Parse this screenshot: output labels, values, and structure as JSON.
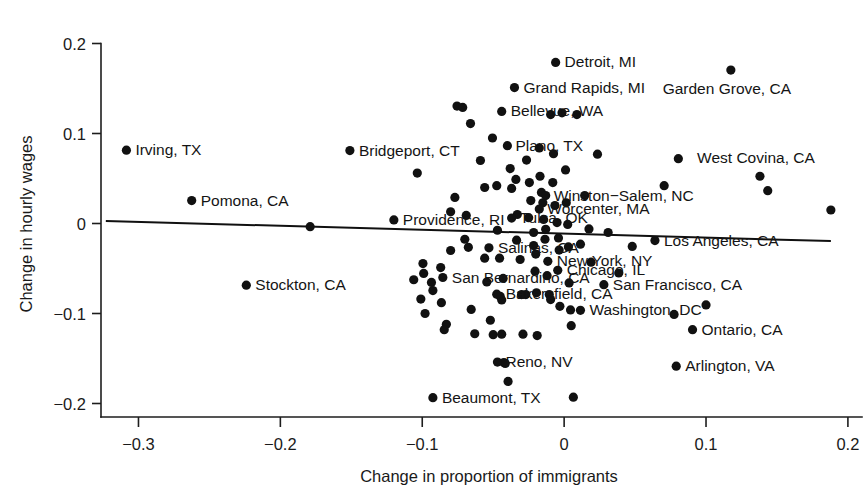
{
  "chart_data": {
    "type": "scatter",
    "title": "",
    "xlabel": "Change in proportion of immigrants",
    "ylabel": "Change in hourly wages",
    "xlim": [
      -0.325,
      0.205
    ],
    "ylim": [
      -0.215,
      0.215
    ],
    "xticks": [
      -0.3,
      -0.2,
      -0.1,
      0,
      0.1,
      0.2
    ],
    "xticklabels": [
      "−0.3",
      "−0.2",
      "−0.1",
      "0",
      "0.1",
      "0.2"
    ],
    "yticks": [
      0.2,
      0.1,
      0,
      -0.1,
      -0.2
    ],
    "yticklabels": [
      "0.2",
      "0.1",
      "0",
      "−0.1",
      "−0.2"
    ],
    "grid": false,
    "legend": null,
    "marker_color": "#111111",
    "trendline": {
      "present": true,
      "color": "#101010",
      "x0": -0.323,
      "y0": 0.0028,
      "x1": 0.188,
      "y1": -0.0195,
      "slope": -0.0436,
      "intercept": -0.0113
    },
    "labeled_points": [
      {
        "city": "Irving, TX",
        "x": -0.3085,
        "y": 0.0815,
        "label_dx": 9,
        "label_dy": 5
      },
      {
        "city": "Pomona, CA",
        "x": -0.2625,
        "y": 0.0255,
        "label_dx": 9,
        "label_dy": 5
      },
      {
        "city": "Stockton, CA",
        "x": -0.224,
        "y": -0.0685,
        "label_dx": 9,
        "label_dy": 5
      },
      {
        "city": "Bridgeport, CT",
        "x": -0.151,
        "y": 0.081,
        "label_dx": 9,
        "label_dy": 5
      },
      {
        "city": "Providence, RI",
        "x": -0.12,
        "y": 0.004,
        "label_dx": 9,
        "label_dy": 5
      },
      {
        "city": "Beaumont, TX",
        "x": -0.0925,
        "y": -0.1935,
        "label_dx": 9,
        "label_dy": 5
      },
      {
        "city": "San Bernardino, CA",
        "x": -0.0855,
        "y": -0.06,
        "label_dx": 9,
        "label_dy": 5
      },
      {
        "city": "Salinas, CA",
        "x": -0.053,
        "y": -0.027,
        "label_dx": 9,
        "label_dy": 5
      },
      {
        "city": "Bakersfield, CA",
        "x": -0.0475,
        "y": -0.0785,
        "label_dx": 9,
        "label_dy": 5
      },
      {
        "city": "Reno, NV",
        "x": -0.047,
        "y": -0.154,
        "label_dx": 8,
        "label_dy": 5
      },
      {
        "city": "Tulsa, OK",
        "x": -0.037,
        "y": 0.006,
        "label_dx": 8,
        "label_dy": 5
      },
      {
        "city": "Grand Rapids, MI",
        "x": -0.035,
        "y": 0.151,
        "label_dx": 9,
        "label_dy": 5
      },
      {
        "city": "Bellevue, WA",
        "x": -0.044,
        "y": 0.1245,
        "label_dx": 9,
        "label_dy": 5
      },
      {
        "city": "Plano, TX",
        "x": -0.04,
        "y": 0.0865,
        "label_dx": 8,
        "label_dy": 5
      },
      {
        "city": "Worcenter, MA",
        "x": -0.0175,
        "y": 0.016,
        "label_dx": 8,
        "label_dy": 5
      },
      {
        "city": "Winston−Salem, NC",
        "x": -0.013,
        "y": 0.031,
        "label_dx": 8,
        "label_dy": 5
      },
      {
        "city": "New York, NY",
        "x": -0.0115,
        "y": -0.042,
        "label_dx": 9,
        "label_dy": 5
      },
      {
        "city": "Chicago, IL",
        "x": -0.0045,
        "y": -0.052,
        "label_dx": 9,
        "label_dy": 5
      },
      {
        "city": "Detroit, MI",
        "x": -0.006,
        "y": 0.179,
        "label_dx": 9,
        "label_dy": 5
      },
      {
        "city": "Washington, DC",
        "x": 0.0115,
        "y": -0.0965,
        "label_dx": 9,
        "label_dy": 5
      },
      {
        "city": "San Francisco, CA",
        "x": 0.028,
        "y": -0.068,
        "label_dx": 9,
        "label_dy": 5
      },
      {
        "city": "Los Angeles, CA",
        "x": 0.064,
        "y": -0.019,
        "label_dx": 9,
        "label_dy": 5
      },
      {
        "city": "Arlington, VA",
        "x": 0.079,
        "y": -0.1585,
        "label_dx": 9,
        "label_dy": 5
      },
      {
        "city": "Ontario, CA",
        "x": 0.0905,
        "y": -0.118,
        "label_dx": 9,
        "label_dy": 5
      },
      {
        "city": "Garden Grove, CA",
        "x": 0.1175,
        "y": 0.1705,
        "label_dx": -4,
        "label_dy": 24
      },
      {
        "city": "West Covina, CA",
        "x": 0.138,
        "y": 0.0525,
        "label_dx": -4,
        "label_dy": -13
      }
    ],
    "unlabeled_points": [
      {
        "x": -0.179,
        "y": -0.0035
      },
      {
        "x": -0.1035,
        "y": 0.056
      },
      {
        "x": -0.106,
        "y": -0.0625
      },
      {
        "x": -0.0995,
        "y": -0.0445
      },
      {
        "x": -0.099,
        "y": -0.0555
      },
      {
        "x": -0.101,
        "y": -0.084
      },
      {
        "x": -0.098,
        "y": -0.1
      },
      {
        "x": -0.0925,
        "y": -0.0745
      },
      {
        "x": -0.0935,
        "y": -0.0655
      },
      {
        "x": -0.087,
        "y": -0.049
      },
      {
        "x": -0.0865,
        "y": -0.088
      },
      {
        "x": -0.083,
        "y": -0.112
      },
      {
        "x": -0.0845,
        "y": -0.118
      },
      {
        "x": -0.08,
        "y": -0.03
      },
      {
        "x": -0.077,
        "y": 0.029
      },
      {
        "x": -0.08,
        "y": 0.013
      },
      {
        "x": -0.0755,
        "y": 0.1305
      },
      {
        "x": -0.0715,
        "y": 0.129
      },
      {
        "x": -0.069,
        "y": 0.009
      },
      {
        "x": -0.07,
        "y": -0.0175
      },
      {
        "x": -0.0675,
        "y": -0.0265
      },
      {
        "x": -0.066,
        "y": 0.111
      },
      {
        "x": -0.0655,
        "y": -0.0955
      },
      {
        "x": -0.063,
        "y": -0.1225
      },
      {
        "x": -0.059,
        "y": 0.07
      },
      {
        "x": -0.056,
        "y": 0.04
      },
      {
        "x": -0.056,
        "y": -0.0385
      },
      {
        "x": -0.0545,
        "y": -0.065
      },
      {
        "x": -0.052,
        "y": -0.1075
      },
      {
        "x": -0.05,
        "y": -0.1235
      },
      {
        "x": -0.0505,
        "y": 0.095
      },
      {
        "x": -0.0475,
        "y": 0.042
      },
      {
        "x": -0.047,
        "y": -0.0075
      },
      {
        "x": -0.0455,
        "y": -0.0385
      },
      {
        "x": -0.043,
        "y": -0.061
      },
      {
        "x": -0.045,
        "y": -0.081
      },
      {
        "x": -0.044,
        "y": -0.085
      },
      {
        "x": -0.044,
        "y": -0.123
      },
      {
        "x": -0.0415,
        "y": -0.1555
      },
      {
        "x": -0.0425,
        "y": -0.1545
      },
      {
        "x": -0.0395,
        "y": -0.1755
      },
      {
        "x": -0.038,
        "y": 0.061
      },
      {
        "x": -0.037,
        "y": 0.039
      },
      {
        "x": -0.034,
        "y": 0.049
      },
      {
        "x": -0.033,
        "y": 0.01
      },
      {
        "x": -0.0335,
        "y": -0.0185
      },
      {
        "x": -0.031,
        "y": -0.04
      },
      {
        "x": -0.03,
        "y": -0.079
      },
      {
        "x": -0.029,
        "y": -0.123
      },
      {
        "x": -0.027,
        "y": -0.079
      },
      {
        "x": -0.0265,
        "y": 0.0705
      },
      {
        "x": -0.0245,
        "y": 0.0455
      },
      {
        "x": -0.0235,
        "y": 0.0255
      },
      {
        "x": -0.025,
        "y": 0.0065
      },
      {
        "x": -0.0215,
        "y": -0.01
      },
      {
        "x": -0.0215,
        "y": -0.0245
      },
      {
        "x": -0.02,
        "y": -0.034
      },
      {
        "x": -0.0205,
        "y": -0.053
      },
      {
        "x": -0.0195,
        "y": -0.077
      },
      {
        "x": -0.019,
        "y": -0.1245
      },
      {
        "x": -0.0175,
        "y": 0.084
      },
      {
        "x": -0.017,
        "y": 0.0525
      },
      {
        "x": -0.016,
        "y": 0.0345
      },
      {
        "x": -0.015,
        "y": 0.023
      },
      {
        "x": -0.0145,
        "y": 0.0045
      },
      {
        "x": -0.013,
        "y": -0.0065
      },
      {
        "x": -0.0135,
        "y": -0.0175
      },
      {
        "x": -0.012,
        "y": -0.058
      },
      {
        "x": -0.0105,
        "y": -0.079
      },
      {
        "x": -0.0095,
        "y": -0.0845
      },
      {
        "x": -0.0095,
        "y": 0.121
      },
      {
        "x": -0.0075,
        "y": 0.0775
      },
      {
        "x": -0.008,
        "y": 0.0455
      },
      {
        "x": -0.0065,
        "y": 0.02
      },
      {
        "x": -0.005,
        "y": 0.001
      },
      {
        "x": -0.004,
        "y": -0.016
      },
      {
        "x": -0.0035,
        "y": -0.0295
      },
      {
        "x": -0.003,
        "y": -0.092
      },
      {
        "x": -0.0015,
        "y": 0.123
      },
      {
        "x": 0.001,
        "y": 0.0595
      },
      {
        "x": 0.0015,
        "y": 0.023
      },
      {
        "x": 0.0025,
        "y": -0.001
      },
      {
        "x": 0.003,
        "y": -0.026
      },
      {
        "x": 0.0035,
        "y": -0.066
      },
      {
        "x": 0.0045,
        "y": -0.096
      },
      {
        "x": 0.005,
        "y": -0.1135
      },
      {
        "x": 0.0065,
        "y": -0.193
      },
      {
        "x": 0.009,
        "y": 0.121
      },
      {
        "x": 0.0115,
        "y": -0.023
      },
      {
        "x": 0.0145,
        "y": 0.031
      },
      {
        "x": 0.0175,
        "y": -0.006
      },
      {
        "x": 0.019,
        "y": -0.043
      },
      {
        "x": 0.0235,
        "y": 0.077
      },
      {
        "x": 0.031,
        "y": -0.01
      },
      {
        "x": 0.0385,
        "y": -0.055
      },
      {
        "x": 0.048,
        "y": -0.0255
      },
      {
        "x": 0.0705,
        "y": 0.042
      },
      {
        "x": 0.0775,
        "y": -0.101
      },
      {
        "x": 0.0805,
        "y": 0.072
      },
      {
        "x": 0.1,
        "y": -0.0905
      },
      {
        "x": 0.1435,
        "y": 0.0365
      },
      {
        "x": 0.188,
        "y": 0.015
      }
    ]
  },
  "meta": {
    "axis_color": "#1d1d1d",
    "background": "#ffffff"
  }
}
